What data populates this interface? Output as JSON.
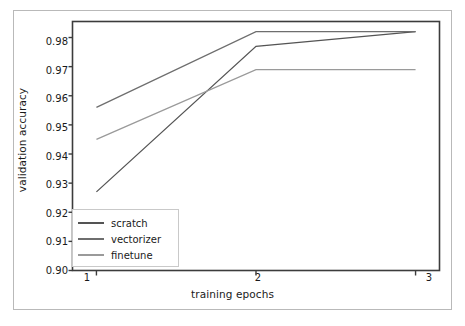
{
  "chart_data": {
    "type": "line",
    "title": "",
    "xlabel": "training epochs",
    "ylabel": "validation accuracy",
    "x": [
      1,
      2,
      3
    ],
    "xlim": [
      0.85,
      3.15
    ],
    "ylim": [
      0.9,
      0.9855
    ],
    "xticks": [
      "1",
      "2",
      "3"
    ],
    "yticks": [
      "0.90",
      "0.91",
      "0.92",
      "0.93",
      "0.94",
      "0.95",
      "0.96",
      "0.97",
      "0.98"
    ],
    "ytick_values": [
      0.9,
      0.91,
      0.92,
      0.93,
      0.94,
      0.95,
      0.96,
      0.97,
      0.98
    ],
    "grid": false,
    "legend_position": "lower left",
    "series": [
      {
        "name": "scratch",
        "values": [
          0.927,
          0.977,
          0.982
        ],
        "color": "#545454"
      },
      {
        "name": "vectorizer",
        "values": [
          0.956,
          0.982,
          0.982
        ],
        "color": "#6e6e6e"
      },
      {
        "name": "finetune",
        "values": [
          0.945,
          0.969,
          0.969
        ],
        "color": "#9a9a9a"
      }
    ]
  },
  "axes": {
    "frame_color": "#3c3c3c",
    "border_color": "#b9b9b9",
    "background": "#ffffff"
  }
}
